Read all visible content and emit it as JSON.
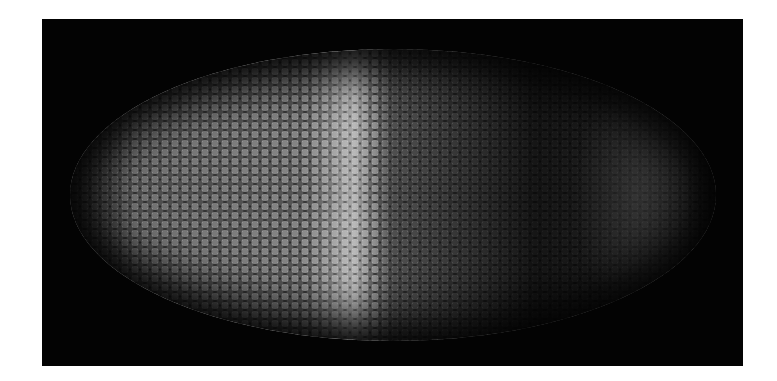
{
  "image": {
    "subject": "fluorescent embryo with nuclei",
    "background_color": "#ffffff",
    "frame_color": "#030303",
    "colors": {
      "anterior_nuclei": "#8a8a8a",
      "stripe_peak": "#b0b0b0",
      "posterior_region": "#1e1e1e"
    }
  }
}
